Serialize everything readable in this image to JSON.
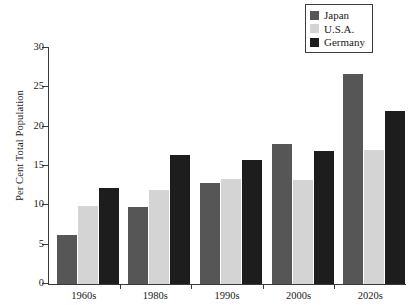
{
  "chart_data": {
    "type": "bar",
    "title": "",
    "subtitle": "",
    "xlabel": "",
    "ylabel": "Per Cent Total Population",
    "categories": [
      "1960s",
      "1980s",
      "1990s",
      "2000s",
      "2020s"
    ],
    "series": [
      {
        "name": "Japan",
        "color": "#565656",
        "values": [
          6.2,
          9.8,
          12.8,
          17.8,
          26.7
        ]
      },
      {
        "name": "U.S.A.",
        "color": "#d4d4d4",
        "values": [
          9.9,
          12.0,
          13.3,
          13.2,
          17.0
        ]
      },
      {
        "name": "Germany",
        "color": "#1d1d1d",
        "values": [
          12.2,
          16.4,
          15.8,
          16.9,
          22.0
        ]
      }
    ],
    "ylim": [
      0,
      30
    ],
    "ytick_values": [
      0,
      5,
      10,
      15,
      20,
      25,
      30
    ],
    "ytick_labels": [
      "0",
      "5",
      "10",
      "15",
      "20",
      "25",
      "30"
    ],
    "grid": false,
    "legend_position": "top-right",
    "legend_entries": [
      "Japan",
      "U.S.A.",
      "Germany"
    ],
    "annotations": []
  }
}
